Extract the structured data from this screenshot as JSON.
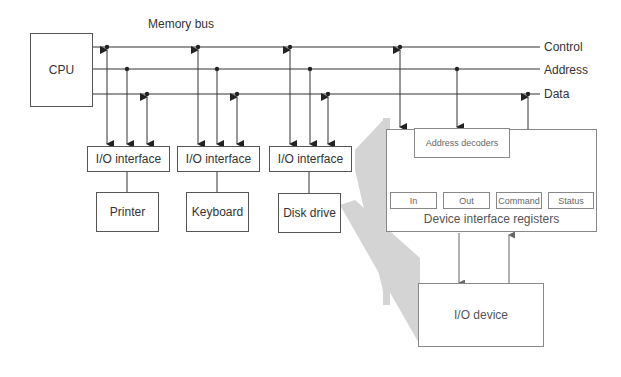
{
  "title": "Memory bus",
  "cpu": {
    "label": "CPU"
  },
  "bus_lines": [
    {
      "label": "Control"
    },
    {
      "label": "Address"
    },
    {
      "label": "Data"
    }
  ],
  "interfaces": [
    {
      "label": "I/O interface",
      "device": "Printer"
    },
    {
      "label": "I/O interface",
      "device": "Keyboard"
    },
    {
      "label": "I/O interface",
      "device": "Disk drive"
    }
  ],
  "detail": {
    "decoder_label": "Address decoders",
    "registers": [
      "In",
      "Out",
      "Command",
      "Status"
    ],
    "registers_caption": "Device interface registers",
    "device_label": "I/O device"
  },
  "colors": {
    "line": "#333333",
    "detail_line": "#666666",
    "shadow": "#d4d4d4"
  }
}
